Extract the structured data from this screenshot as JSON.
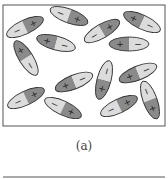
{
  "figure": {
    "caption": "(a)",
    "colors": {
      "positive_fill": "#8a8a8a",
      "negative_fill": "#dcdcdc",
      "outline": "#333333",
      "frame": "#555555",
      "background": "#ffffff"
    },
    "positive_symbol": "+",
    "negative_symbol": "−",
    "dipoles": [
      {
        "cx": 25,
        "cy": 27,
        "angle": -25,
        "pos_side": "right"
      },
      {
        "cx": 69,
        "cy": 16,
        "angle": 20,
        "pos_side": "right"
      },
      {
        "cx": 102,
        "cy": 31,
        "angle": -30,
        "pos_side": "right"
      },
      {
        "cx": 142,
        "cy": 22,
        "angle": 25,
        "pos_side": "left"
      },
      {
        "cx": 56,
        "cy": 43,
        "angle": 15,
        "pos_side": "left"
      },
      {
        "cx": 129,
        "cy": 44,
        "angle": 0,
        "pos_side": "left"
      },
      {
        "cx": 26,
        "cy": 58,
        "angle": 58,
        "pos_side": "left"
      },
      {
        "cx": 74,
        "cy": 82,
        "angle": -22,
        "pos_side": "left"
      },
      {
        "cx": 104,
        "cy": 80,
        "angle": -75,
        "pos_side": "left"
      },
      {
        "cx": 138,
        "cy": 73,
        "angle": -22,
        "pos_side": "left"
      },
      {
        "cx": 26,
        "cy": 98,
        "angle": -25,
        "pos_side": "right"
      },
      {
        "cx": 63,
        "cy": 108,
        "angle": 25,
        "pos_side": "right"
      },
      {
        "cx": 119,
        "cy": 106,
        "angle": -25,
        "pos_side": "right"
      },
      {
        "cx": 150,
        "cy": 100,
        "angle": 70,
        "pos_side": "right"
      }
    ]
  }
}
